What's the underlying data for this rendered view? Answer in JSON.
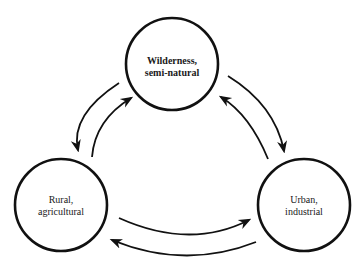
{
  "diagram": {
    "type": "cycle",
    "nodes": [
      {
        "id": "wilderness",
        "line1": "Wilderness,",
        "line2": "semi-natural",
        "cx": 172,
        "cy": 64,
        "r": 46
      },
      {
        "id": "rural",
        "line1": "Rural,",
        "line2": "agricultural",
        "cx": 61,
        "cy": 205,
        "r": 46
      },
      {
        "id": "urban",
        "line1": "Urban,",
        "line2": "industrial",
        "cx": 304,
        "cy": 205,
        "r": 46
      }
    ],
    "edges": [
      {
        "from": "wilderness",
        "to": "rural"
      },
      {
        "from": "rural",
        "to": "wilderness"
      },
      {
        "from": "wilderness",
        "to": "urban"
      },
      {
        "from": "urban",
        "to": "wilderness"
      },
      {
        "from": "rural",
        "to": "urban"
      },
      {
        "from": "urban",
        "to": "rural"
      }
    ],
    "stroke_color": "#111111"
  }
}
